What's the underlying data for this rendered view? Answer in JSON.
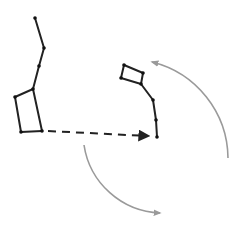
{
  "diagram": {
    "colors": {
      "background": "#ffffff",
      "constellation_line": "#222222",
      "star": "#111111",
      "pointer_line": "#222222",
      "rotation_arrow": "#9a9a9a"
    },
    "big_dipper": {
      "stars": [
        {
          "x": 35,
          "y": 18
        },
        {
          "x": 44,
          "y": 48
        },
        {
          "x": 39,
          "y": 66
        },
        {
          "x": 33,
          "y": 89
        },
        {
          "x": 15,
          "y": 97
        },
        {
          "x": 21,
          "y": 132
        },
        {
          "x": 42,
          "y": 131
        }
      ],
      "edges": [
        [
          0,
          1
        ],
        [
          1,
          2
        ],
        [
          2,
          3
        ],
        [
          3,
          4
        ],
        [
          4,
          5
        ],
        [
          5,
          6
        ],
        [
          6,
          3
        ]
      ]
    },
    "little_dipper": {
      "stars": [
        {
          "x": 157,
          "y": 137
        },
        {
          "x": 156,
          "y": 120
        },
        {
          "x": 153,
          "y": 100
        },
        {
          "x": 141,
          "y": 84
        },
        {
          "x": 121,
          "y": 78
        },
        {
          "x": 124,
          "y": 65
        },
        {
          "x": 143,
          "y": 73
        }
      ],
      "edges": [
        [
          0,
          1
        ],
        [
          1,
          2
        ],
        [
          2,
          3
        ],
        [
          3,
          6
        ],
        [
          6,
          5
        ],
        [
          5,
          4
        ],
        [
          4,
          3
        ]
      ]
    },
    "pointer": {
      "from": {
        "x": 42,
        "y": 131
      },
      "to": {
        "x": 152,
        "y": 137
      },
      "style": "dashed"
    },
    "rotation_arrows": [
      {
        "name": "upper-right-arc",
        "path": "M 228 158 A 100 100 0 0 0 152 62",
        "arrow_at": "end"
      },
      {
        "name": "lower-left-arc",
        "path": "M 84 145 A 80 80 0 0 0 160 213",
        "arrow_at": "end"
      }
    ]
  }
}
